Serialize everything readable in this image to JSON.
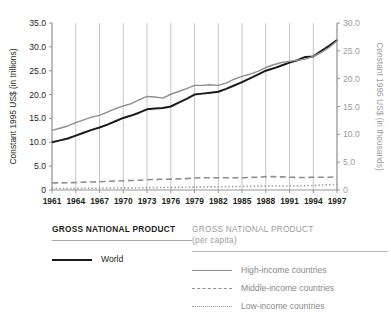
{
  "chart_data": {
    "type": "line",
    "title": "",
    "xlabel": "",
    "grid": "vertical-only",
    "legend_position": "below",
    "x": [
      1961,
      1962,
      1963,
      1964,
      1965,
      1966,
      1967,
      1968,
      1969,
      1970,
      1971,
      1972,
      1973,
      1974,
      1975,
      1976,
      1977,
      1978,
      1979,
      1980,
      1981,
      1982,
      1983,
      1984,
      1985,
      1986,
      1987,
      1988,
      1989,
      1990,
      1991,
      1992,
      1993,
      1994,
      1995,
      1996,
      1997
    ],
    "xtick_labels": [
      "1961",
      "1964",
      "1967",
      "1970",
      "1973",
      "1976",
      "1979",
      "1982",
      "1985",
      "1988",
      "1991",
      "1994",
      "1997"
    ],
    "left_axis": {
      "label": "Constant 1995 US$ (in trillions)",
      "ticks": [
        "0",
        "5.0",
        "10.0",
        "15.0",
        "20.0",
        "25.0",
        "30.0",
        "35.0"
      ],
      "tick_values": [
        0,
        5,
        10,
        15,
        20,
        25,
        30,
        35
      ],
      "ylim": [
        0,
        35
      ]
    },
    "right_axis": {
      "label": "Constant 1995 US$ (in thousands)",
      "ticks": [
        "0",
        "5.0",
        "10.0",
        "15.0",
        "20.0",
        "25.0",
        "30.0"
      ],
      "tick_values": [
        0,
        5,
        10,
        15,
        20,
        25,
        30
      ],
      "ylim": [
        0,
        30
      ]
    },
    "series": [
      {
        "name": "World",
        "group": "GROSS NATIONAL PRODUCT",
        "axis": "left",
        "style": "solid",
        "color": "#1a1a1a",
        "width": 2,
        "values": [
          10.0,
          10.4,
          10.8,
          11.4,
          12.0,
          12.6,
          13.1,
          13.7,
          14.4,
          15.1,
          15.6,
          16.2,
          16.9,
          17.1,
          17.2,
          17.5,
          18.3,
          19.1,
          20.0,
          20.2,
          20.4,
          20.6,
          21.2,
          21.9,
          22.6,
          23.4,
          24.2,
          25.0,
          25.5,
          26.1,
          26.7,
          27.2,
          27.9,
          28.0,
          29.1,
          30.2,
          31.4
        ]
      },
      {
        "name": "High-income countries",
        "group": "GROSS NATIONAL PRODUCT (per capita)",
        "axis": "right",
        "style": "solid",
        "color": "#8e8e8e",
        "width": 1.4,
        "values": [
          10.7,
          11.1,
          11.5,
          12.1,
          12.6,
          13.1,
          13.4,
          14.0,
          14.6,
          15.1,
          15.5,
          16.2,
          16.8,
          16.7,
          16.5,
          17.2,
          17.7,
          18.2,
          18.8,
          18.8,
          18.9,
          18.8,
          19.2,
          19.9,
          20.4,
          20.8,
          21.3,
          22.0,
          22.5,
          22.9,
          23.1,
          23.3,
          23.5,
          24.0,
          24.7,
          25.6,
          26.8
        ]
      },
      {
        "name": "Middle-income countries",
        "group": "GROSS NATIONAL PRODUCT (per capita)",
        "axis": "right",
        "style": "dashed",
        "color": "#8e8e8e",
        "width": 1.6,
        "values": [
          1.25,
          1.28,
          1.3,
          1.35,
          1.4,
          1.45,
          1.48,
          1.55,
          1.6,
          1.65,
          1.7,
          1.75,
          1.85,
          1.9,
          1.93,
          1.95,
          2.0,
          2.05,
          2.15,
          2.2,
          2.2,
          2.2,
          2.2,
          2.2,
          2.2,
          2.25,
          2.3,
          2.4,
          2.4,
          2.35,
          2.3,
          2.25,
          2.25,
          2.3,
          2.3,
          2.3,
          2.35
        ]
      },
      {
        "name": "Low-income countries",
        "group": "GROSS NATIONAL PRODUCT (per capita)",
        "axis": "right",
        "style": "dotted",
        "color": "#9a9a9a",
        "width": 1.6,
        "values": [
          0.25,
          0.26,
          0.27,
          0.28,
          0.3,
          0.31,
          0.32,
          0.34,
          0.36,
          0.38,
          0.39,
          0.4,
          0.42,
          0.43,
          0.44,
          0.46,
          0.48,
          0.5,
          0.52,
          0.54,
          0.56,
          0.58,
          0.6,
          0.62,
          0.64,
          0.66,
          0.68,
          0.7,
          0.72,
          0.72,
          0.72,
          0.74,
          0.78,
          0.82,
          0.88,
          0.95,
          1.02
        ]
      }
    ]
  },
  "legend": {
    "left": {
      "title": "GROSS NATIONAL PRODUCT",
      "items": [
        {
          "label": "World",
          "style": "sw-solid-dark",
          "muted": false
        }
      ]
    },
    "right": {
      "title": "GROSS NATIONAL PRODUCT",
      "subtitle": "(per capita)",
      "items": [
        {
          "label": "High-income countries",
          "style": "sw-solid-gray",
          "muted": true
        },
        {
          "label": "Middle-income countries",
          "style": "sw-dashed",
          "muted": true
        },
        {
          "label": "Low-income countries",
          "style": "sw-dotted",
          "muted": true
        }
      ]
    }
  },
  "colors": {
    "world_line": "#1a1a1a",
    "percapita_line": "#8e8e8e",
    "gridline": "#b0b0b0",
    "axis": "#8a8a8a",
    "muted_text": "#9b9b9b",
    "text": "#231f20"
  }
}
